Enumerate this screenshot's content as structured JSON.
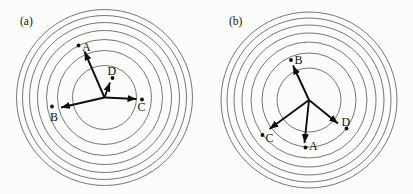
{
  "figure": {
    "background_color": "#fcfcfb",
    "circle_color": "#4a4a4a",
    "arrow_color": "#0e0e0e",
    "text_color": "#141414",
    "circle_radii": [
      32,
      47,
      58,
      67,
      75,
      82,
      88
    ],
    "panels": [
      {
        "id": "a",
        "label": "(a)",
        "label_x": 20,
        "label_y": 25,
        "center_x": 104.5,
        "center_y": 97.5,
        "vectors": [
          {
            "name": "A",
            "tip_x": 84.5,
            "tip_y": 51.5,
            "dot_x": 78.5,
            "dot_y": 45.5,
            "label_x": 82,
            "label_y": 50.5
          },
          {
            "name": "B",
            "tip_x": 61,
            "tip_y": 107.5,
            "dot_x": 52,
            "dot_y": 106.5,
            "label_x": 50,
            "label_y": 120.5
          },
          {
            "name": "C",
            "tip_x": 136.5,
            "tip_y": 99,
            "dot_x": 142,
            "dot_y": 99.5,
            "label_x": 137.5,
            "label_y": 111
          },
          {
            "name": "D",
            "tip_x": 110,
            "tip_y": 82.5,
            "dot_x": 112.5,
            "dot_y": 78,
            "label_x": 107.5,
            "label_y": 75
          }
        ]
      },
      {
        "id": "b",
        "label": "(b)",
        "label_x": 229,
        "label_y": 25,
        "center_x": 309,
        "center_y": 100,
        "vectors": [
          {
            "name": "B",
            "tip_x": 293,
            "tip_y": 65.5,
            "dot_x": 291,
            "dot_y": 60,
            "label_x": 294.5,
            "label_y": 64
          },
          {
            "name": "C",
            "tip_x": 269.5,
            "tip_y": 129,
            "dot_x": 262.5,
            "dot_y": 135,
            "label_x": 265.5,
            "label_y": 142
          },
          {
            "name": "A",
            "tip_x": 304.5,
            "tip_y": 143,
            "dot_x": 305.5,
            "dot_y": 147.5,
            "label_x": 309,
            "label_y": 150
          },
          {
            "name": "D",
            "tip_x": 338,
            "tip_y": 123.5,
            "dot_x": 346.5,
            "dot_y": 128.5,
            "label_x": 341.5,
            "label_y": 126
          }
        ]
      }
    ]
  }
}
